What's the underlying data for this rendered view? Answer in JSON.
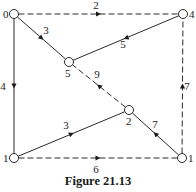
{
  "figure": {
    "caption": "Figure 21.13",
    "colors": {
      "stroke": "#2a2a2a",
      "node_fill": "#ffffff",
      "background": "#ffffff"
    }
  },
  "nodes": [
    {
      "id": "n0",
      "label": "0",
      "x": 14,
      "y": 14,
      "label_dx": -11,
      "label_dy": 4
    },
    {
      "id": "n4",
      "label": "4",
      "x": 183,
      "y": 14,
      "label_dx": 6,
      "label_dy": 4
    },
    {
      "id": "n5",
      "label": "5",
      "x": 69,
      "y": 62,
      "label_dx": -4,
      "label_dy": 15
    },
    {
      "id": "n2",
      "label": "2",
      "x": 129,
      "y": 110,
      "label_dx": -3,
      "label_dy": 15
    },
    {
      "id": "n1a",
      "label": "1",
      "x": 14,
      "y": 158,
      "label_dx": -11,
      "label_dy": 4
    },
    {
      "id": "n1b",
      "label": "1",
      "x": 182,
      "y": 158,
      "label_dx": 6,
      "label_dy": 4
    }
  ],
  "edges": [
    {
      "id": "e-0-4",
      "from": "n0",
      "to": "n4",
      "weight": "2",
      "style": "dashed",
      "label_x": 96,
      "label_y": 9
    },
    {
      "id": "e-0-5",
      "from": "n0",
      "to": "n5",
      "weight": "3",
      "style": "solid",
      "label_x": 46,
      "label_y": 34
    },
    {
      "id": "e-0-1a",
      "from": "n0",
      "to": "n1a",
      "weight": "4",
      "style": "solid",
      "label_x": 3,
      "label_y": 90
    },
    {
      "id": "e-4-5",
      "from": "n4",
      "to": "n5",
      "weight": "5",
      "style": "solid",
      "label_x": 123,
      "label_y": 48
    },
    {
      "id": "e-2-5",
      "from": "n2",
      "to": "n5",
      "weight": "9",
      "style": "dashed",
      "label_x": 97,
      "label_y": 78
    },
    {
      "id": "e-1a-2",
      "from": "n1a",
      "to": "n2",
      "weight": "3",
      "style": "solid",
      "label_x": 66,
      "label_y": 129
    },
    {
      "id": "e-1b-2",
      "from": "n1b",
      "to": "n2",
      "weight": "7",
      "style": "solid",
      "label_x": 155,
      "label_y": 128
    },
    {
      "id": "e-1a-1b",
      "from": "n1a",
      "to": "n1b",
      "weight": "6",
      "style": "dashed",
      "label_x": 96,
      "label_y": 173
    },
    {
      "id": "e-1b-4",
      "from": "n1b",
      "to": "n4",
      "weight": "7",
      "style": "dashed",
      "label_x": 187,
      "label_y": 90
    }
  ]
}
